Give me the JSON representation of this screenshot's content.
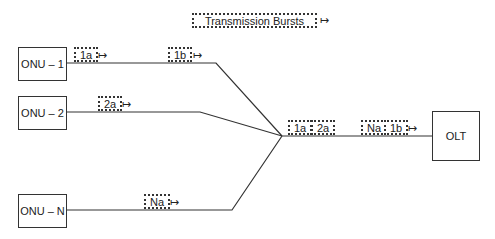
{
  "legend": {
    "label": "Transmission Bursts"
  },
  "nodes": {
    "onu1": "ONU – 1",
    "onu2": "ONU – 2",
    "onuN": "ONU – N",
    "olt": "OLT"
  },
  "bursts": {
    "onu1_a": "1a",
    "onu1_b": "1b",
    "onu2_a": "2a",
    "onuN_a": "Na",
    "trunk1_a": "1a",
    "trunk1_b": "2a",
    "trunk2_a": "Na",
    "trunk2_b": "1b"
  },
  "arrow_glyph": "↦"
}
